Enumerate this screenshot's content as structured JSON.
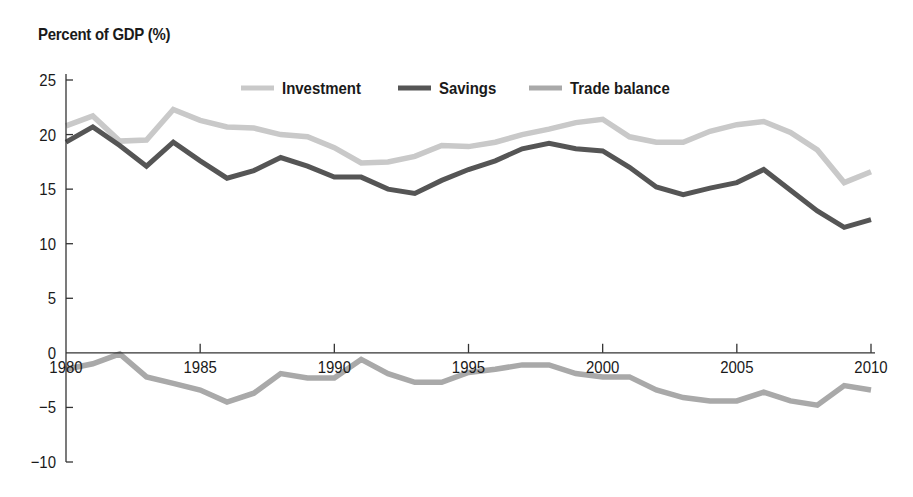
{
  "chart_data": {
    "type": "line",
    "title": "",
    "ylabel": "Percent of GDP (%)",
    "xlabel": "",
    "ylim": [
      -10,
      25
    ],
    "xlim": [
      1980,
      2010
    ],
    "yticks": [
      25,
      20,
      15,
      10,
      5,
      0,
      -5,
      -10
    ],
    "ytick_labels": [
      "25",
      "20",
      "15",
      "10",
      "5",
      "0",
      "−5",
      "−10"
    ],
    "xticks": [
      1980,
      1985,
      1990,
      1995,
      2000,
      2005,
      2010
    ],
    "xtick_labels": [
      "1980",
      "1985",
      "1990",
      "1995",
      "2000",
      "2005",
      "2010"
    ],
    "grid": false,
    "legend_position": "top-center",
    "x": [
      1980,
      1981,
      1982,
      1983,
      1984,
      1985,
      1986,
      1987,
      1988,
      1989,
      1990,
      1991,
      1992,
      1993,
      1994,
      1995,
      1996,
      1997,
      1998,
      1999,
      2000,
      2001,
      2002,
      2003,
      2004,
      2005,
      2006,
      2007,
      2008,
      2009,
      2010
    ],
    "series": [
      {
        "name": "Investment",
        "color": "#c9c9c9",
        "values": [
          20.8,
          21.7,
          19.4,
          19.5,
          22.3,
          21.3,
          20.7,
          20.6,
          20.0,
          19.8,
          18.8,
          17.4,
          17.5,
          18.0,
          19.0,
          18.9,
          19.3,
          20.0,
          20.5,
          21.1,
          21.4,
          19.8,
          19.3,
          19.3,
          20.3,
          20.9,
          21.2,
          20.2,
          18.6,
          15.6,
          16.6
        ]
      },
      {
        "name": "Savings",
        "color": "#555555",
        "values": [
          19.3,
          20.7,
          19.0,
          17.1,
          19.3,
          17.6,
          16.0,
          16.7,
          17.9,
          17.1,
          16.1,
          16.1,
          15.0,
          14.6,
          15.8,
          16.8,
          17.6,
          18.7,
          19.2,
          18.7,
          18.5,
          17.0,
          15.2,
          14.5,
          15.1,
          15.6,
          16.8,
          14.9,
          13.0,
          11.5,
          12.2
        ]
      },
      {
        "name": "Trade balance",
        "color": "#a9a9a9",
        "values": [
          -1.5,
          -1.0,
          -0.1,
          -2.2,
          -2.8,
          -3.4,
          -4.5,
          -3.7,
          -1.9,
          -2.3,
          -2.3,
          -0.6,
          -1.9,
          -2.7,
          -2.7,
          -1.8,
          -1.5,
          -1.1,
          -1.1,
          -1.9,
          -2.2,
          -2.2,
          -3.4,
          -4.1,
          -4.4,
          -4.4,
          -3.6,
          -4.4,
          -4.8,
          -3.0,
          -3.4
        ]
      }
    ]
  },
  "legend": {
    "items": [
      {
        "label": "Investment",
        "color": "#c9c9c9"
      },
      {
        "label": "Savings",
        "color": "#555555"
      },
      {
        "label": "Trade balance",
        "color": "#a9a9a9"
      }
    ]
  },
  "axes": {
    "y_title": "Percent of GDP (%)",
    "axis_color": "#333333"
  }
}
